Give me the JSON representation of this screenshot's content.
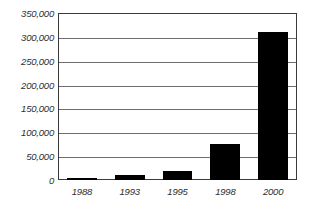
{
  "chart_data": {
    "type": "bar",
    "title": "",
    "subtitle": "",
    "xlabel": "",
    "ylabel": "",
    "categories": [
      "1988",
      "1993",
      "1995",
      "1998",
      "2000"
    ],
    "values": [
      4000,
      10000,
      18000,
      76000,
      310000
    ],
    "ylim": [
      0,
      350000
    ],
    "yticks": [
      0,
      50000,
      100000,
      150000,
      200000,
      250000,
      300000,
      350000
    ],
    "ytick_labels": [
      "0",
      "50,000",
      "100,000",
      "150,000",
      "200,000",
      "250,000",
      "300,000",
      "350,000"
    ],
    "grid": true,
    "grid_axis": "y",
    "legend": false,
    "legend_position": "none",
    "bar_color": "#000000",
    "frame_color": "#3a3a3a",
    "gridline_color": "#6e6e6e",
    "background_color": "#ffffff",
    "text_color": "#2e2e2e",
    "series": [
      {
        "name": "Value",
        "values": [
          4000,
          10000,
          18000,
          76000,
          310000
        ]
      }
    ]
  }
}
